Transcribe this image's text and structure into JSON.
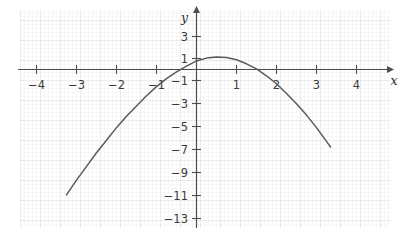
{
  "figure": {
    "kind": "coordinate-grid-plot",
    "background_color": "#ffffff",
    "grid_minor_color": "#ececec",
    "grid_major_color": "#dcdcdc",
    "axis_color": "#4d4d4d",
    "curve_color": "#5a5a5a",
    "label_color": "#3b3b3b"
  },
  "axes": {
    "x_axis_name": "x",
    "y_axis_name": "y",
    "x_tick_labels": [
      "−4",
      "−3",
      "−2",
      "−1",
      "1",
      "2",
      "3",
      "4"
    ],
    "x_tick_values": [
      -4,
      -3,
      -2,
      -1,
      1,
      2,
      3,
      4
    ],
    "y_tick_labels": [
      "3",
      "1",
      "−1",
      "−3",
      "−5",
      "−7",
      "−9",
      "−11",
      "−13"
    ],
    "y_tick_values": [
      3,
      1,
      -1,
      -3,
      -5,
      -7,
      -9,
      -11,
      -13
    ],
    "x_range": [
      -4.4,
      4.85
    ],
    "y_range": [
      -14.2,
      4.2
    ]
  },
  "chart_data": {
    "type": "line",
    "title": "",
    "xlabel": "x",
    "ylabel": "y",
    "xlim": [
      -4.4,
      4.85
    ],
    "ylim": [
      -14.2,
      4.2
    ],
    "grid": true,
    "legend": "none",
    "series": [
      {
        "name": "parabola",
        "description": "downward-opening parabola, vertex near (0.5, 1.1)",
        "vertex": [
          0.5,
          1.1
        ],
        "x_intercepts": [
          -0.65,
          1.65
        ],
        "y_intercept": 1.0,
        "x": [
          -3.25,
          -3.0,
          -2.75,
          -2.5,
          -2.25,
          -2.0,
          -1.75,
          -1.5,
          -1.25,
          -1.0,
          -0.75,
          -0.5,
          -0.25,
          0.0,
          0.25,
          0.5,
          0.75,
          1.0,
          1.25,
          1.5,
          1.75,
          2.0,
          2.25,
          2.5,
          2.75,
          3.0,
          3.25,
          3.35
        ],
        "y": [
          -11.0,
          -9.7,
          -8.5,
          -7.3,
          -6.2,
          -5.1,
          -4.1,
          -3.2,
          -2.3,
          -1.5,
          -0.8,
          -0.2,
          0.3,
          0.75,
          1.0,
          1.1,
          1.05,
          0.85,
          0.5,
          0.05,
          -0.55,
          -1.25,
          -2.1,
          -3.0,
          -4.0,
          -5.1,
          -6.3,
          -6.8
        ],
        "x_labeled_tick_step": 1,
        "y_labeled_tick_step": 2
      }
    ]
  }
}
